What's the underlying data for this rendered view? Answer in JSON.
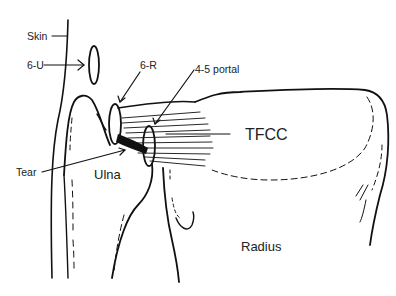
{
  "diagram": {
    "type": "anatomical-illustration",
    "labels": {
      "skin": "Skin",
      "six_u": "6-U",
      "six_r": "6-R",
      "four_five_portal": "4-5 portal",
      "tfcc": "TFCC",
      "tear": "Tear",
      "ulna": "Ulna",
      "radius": "Radius"
    },
    "colors": {
      "line": "#111111",
      "text": "#222222",
      "background": "#ffffff"
    }
  }
}
